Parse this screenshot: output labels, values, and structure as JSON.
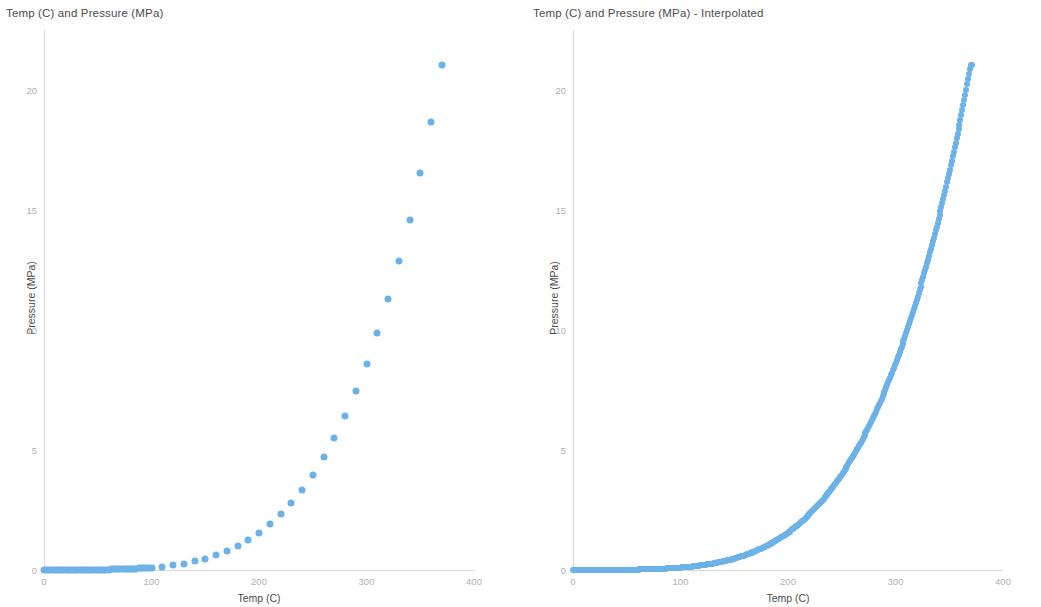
{
  "charts": [
    {
      "title": "Temp (C) and Pressure (MPa)",
      "xlabel": "Temp (C)",
      "ylabel": "Pressure (MPa)",
      "xticks": [
        "0",
        "100",
        "200",
        "300",
        "400"
      ],
      "yticks": [
        "0",
        "5",
        "10",
        "15",
        "20"
      ]
    },
    {
      "title": "Temp (C) and Pressure (MPa) - Interpolated",
      "xlabel": "Temp (C)",
      "ylabel": "Pressure (MPa)",
      "xticks": [
        "0",
        "100",
        "200",
        "300",
        "400"
      ],
      "yticks": [
        "0",
        "5",
        "10",
        "15",
        "20"
      ]
    }
  ],
  "style": {
    "marker_color": "#6cb2e8",
    "title_color": "#4c4c4c",
    "tick_color": "#b0b0b0",
    "axis_color": "#d8d8d8",
    "background": "#ffffff"
  },
  "chart_data": [
    {
      "type": "scatter",
      "title": "Temp (C) and Pressure (MPa)",
      "xlabel": "Temp (C)",
      "ylabel": "Pressure (MPa)",
      "xlim": [
        0,
        400
      ],
      "ylim": [
        0,
        22.5
      ],
      "xticks": [
        0,
        100,
        200,
        300,
        400
      ],
      "yticks": [
        0,
        5,
        10,
        15,
        20
      ],
      "grid": false,
      "legend": "none",
      "marker_color": "#6cb2e8",
      "series": [
        {
          "name": "Saturation pressure",
          "x": [
            0,
            2,
            4,
            6,
            8,
            10,
            12,
            14,
            16,
            18,
            20,
            22,
            24,
            26,
            28,
            30,
            32,
            34,
            36,
            38,
            40,
            42,
            44,
            46,
            48,
            50,
            52,
            54,
            56,
            58,
            60,
            62,
            64,
            66,
            68,
            70,
            72,
            74,
            76,
            78,
            80,
            82,
            84,
            86,
            88,
            90,
            92,
            94,
            96,
            98,
            100,
            110,
            120,
            130,
            140,
            150,
            160,
            170,
            180,
            190,
            200,
            210,
            220,
            230,
            240,
            250,
            260,
            270,
            280,
            290,
            300,
            310,
            320,
            330,
            340,
            350,
            360,
            370
          ],
          "y": [
            0.0006,
            0.0007,
            0.0008,
            0.0009,
            0.0011,
            0.0012,
            0.0014,
            0.0016,
            0.0018,
            0.0021,
            0.0023,
            0.0027,
            0.003,
            0.0034,
            0.0038,
            0.0042,
            0.0048,
            0.0053,
            0.0059,
            0.0066,
            0.0074,
            0.0082,
            0.0091,
            0.0101,
            0.0112,
            0.0123,
            0.0136,
            0.015,
            0.0166,
            0.0182,
            0.0199,
            0.0219,
            0.0239,
            0.0262,
            0.0286,
            0.0312,
            0.034,
            0.037,
            0.0402,
            0.0437,
            0.0474,
            0.0513,
            0.0556,
            0.0601,
            0.065,
            0.0701,
            0.0757,
            0.0815,
            0.0878,
            0.0945,
            0.1014,
            0.1434,
            0.1986,
            0.2703,
            0.3615,
            0.4762,
            0.6182,
            0.7926,
            1.0028,
            1.2552,
            1.5549,
            1.9077,
            2.3196,
            2.7971,
            3.3469,
            3.9762,
            4.6923,
            5.5032,
            6.4166,
            7.4418,
            8.5879,
            9.8651,
            11.284,
            12.858,
            14.601,
            16.529,
            18.666,
            21.044
          ],
          "point_count": 78
        }
      ]
    },
    {
      "type": "line",
      "title": "Temp (C) and Pressure (MPa) - Interpolated",
      "xlabel": "Temp (C)",
      "ylabel": "Pressure (MPa)",
      "xlim": [
        0,
        400
      ],
      "ylim": [
        0,
        22.5
      ],
      "xticks": [
        0,
        100,
        200,
        300,
        400
      ],
      "yticks": [
        0,
        5,
        10,
        15,
        20
      ],
      "grid": false,
      "legend": "none",
      "marker_color": "#6cb2e8",
      "series": [
        {
          "name": "Saturation pressure (interpolated)",
          "x_range": [
            0,
            371
          ],
          "x_step": 1,
          "description": "Dense interpolated saturation curve from 0 C to 371 C, rising from ~0 MPa to ~22.1 MPa",
          "y_at": {
            "0": 0.0006,
            "50": 0.0123,
            "100": 0.1014,
            "150": 0.4762,
            "200": 1.5549,
            "250": 3.9762,
            "300": 8.5879,
            "340": 14.601,
            "360": 18.666,
            "371": 21.4
          }
        }
      ]
    }
  ]
}
